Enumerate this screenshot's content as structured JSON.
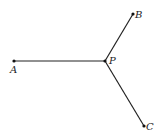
{
  "diagram": {
    "type": "geometry-figure",
    "points": [
      {
        "id": "A",
        "label": "A",
        "x": 14,
        "y": 61
      },
      {
        "id": "P",
        "label": "P",
        "x": 105,
        "y": 61
      },
      {
        "id": "B",
        "label": "B",
        "x": 133,
        "y": 14
      },
      {
        "id": "C",
        "label": "C",
        "x": 144,
        "y": 126
      }
    ],
    "segments": [
      {
        "from": "P",
        "to": "A"
      },
      {
        "from": "P",
        "to": "B"
      },
      {
        "from": "P",
        "to": "C"
      }
    ],
    "colors": {
      "line": "#222222",
      "point": "#111111",
      "label": "#222222"
    }
  }
}
